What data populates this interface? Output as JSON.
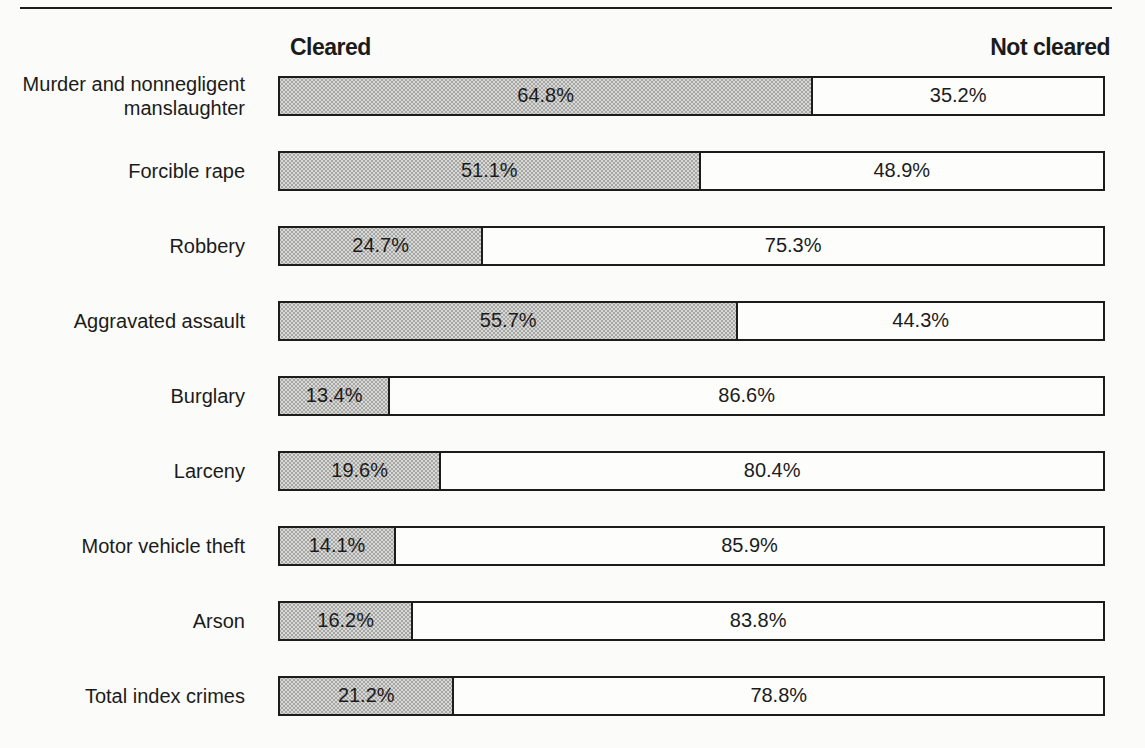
{
  "figure": {
    "background": "#fbfbf9",
    "rule_color": "#1c1c1c",
    "cleared_fill": "#d8d8d6",
    "not_cleared_fill": "#fdfdfc",
    "bar_border_color": "#1c1c1c"
  },
  "header": {
    "cleared_label": "Cleared",
    "not_cleared_label": "Not cleared"
  },
  "rows": [
    {
      "category": "Murder and nonnegligent manslaughter",
      "cleared": 64.8,
      "not_cleared": 35.2,
      "cleared_text": "64.8%",
      "not_cleared_text": "35.2%"
    },
    {
      "category": "Forcible rape",
      "cleared": 51.1,
      "not_cleared": 48.9,
      "cleared_text": "51.1%",
      "not_cleared_text": "48.9%"
    },
    {
      "category": "Robbery",
      "cleared": 24.7,
      "not_cleared": 75.3,
      "cleared_text": "24.7%",
      "not_cleared_text": "75.3%"
    },
    {
      "category": "Aggravated assault",
      "cleared": 55.7,
      "not_cleared": 44.3,
      "cleared_text": "55.7%",
      "not_cleared_text": "44.3%"
    },
    {
      "category": "Burglary",
      "cleared": 13.4,
      "not_cleared": 86.6,
      "cleared_text": "13.4%",
      "not_cleared_text": "86.6%"
    },
    {
      "category": "Larceny",
      "cleared": 19.6,
      "not_cleared": 80.4,
      "cleared_text": "19.6%",
      "not_cleared_text": "80.4%"
    },
    {
      "category": "Motor vehicle theft",
      "cleared": 14.1,
      "not_cleared": 85.9,
      "cleared_text": "14.1%",
      "not_cleared_text": "85.9%"
    },
    {
      "category": "Arson",
      "cleared": 16.2,
      "not_cleared": 83.8,
      "cleared_text": "16.2%",
      "not_cleared_text": "83.8%"
    },
    {
      "category": "Total index crimes",
      "cleared": 21.2,
      "not_cleared": 78.8,
      "cleared_text": "21.2%",
      "not_cleared_text": "78.8%"
    }
  ],
  "chart_data": {
    "type": "bar",
    "subtype": "horizontal-stacked-100percent",
    "title": "",
    "categories": [
      "Murder and nonnegligent manslaughter",
      "Forcible rape",
      "Robbery",
      "Aggravated assault",
      "Burglary",
      "Larceny",
      "Motor vehicle theft",
      "Arson",
      "Total index crimes"
    ],
    "series": [
      {
        "name": "Cleared",
        "values": [
          64.8,
          51.1,
          24.7,
          55.7,
          13.4,
          19.6,
          14.1,
          16.2,
          21.2
        ],
        "fill": "#d8d8d6"
      },
      {
        "name": "Not cleared",
        "values": [
          35.2,
          48.9,
          75.3,
          44.3,
          86.6,
          80.4,
          85.9,
          83.8,
          78.8
        ],
        "fill": "#ffffff"
      }
    ],
    "value_suffix": "%",
    "xlim": [
      0,
      100
    ],
    "grid": false,
    "legend_position": "column-headers-above-bars",
    "data_labels": "inside-segment-centered"
  }
}
